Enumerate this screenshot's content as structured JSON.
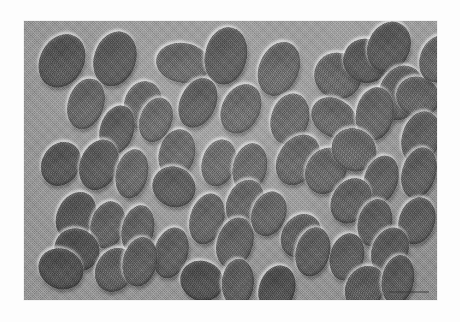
{
  "figure": {
    "kind": "light-micrograph",
    "caption": "",
    "plate": {
      "background_color": "#9c9c9c",
      "page_color": "#ffffff",
      "cell_fill_color": "#5f5f5f",
      "cell_dark_color": "#4a4a4a",
      "cell_highlight_color": "#ffffff",
      "left": 24,
      "top": 21,
      "width": 413,
      "height": 279
    },
    "overlays": {
      "scale_bar_label": ""
    },
    "specimen": {
      "object_name": "ellipsoidal-cell",
      "count": 57
    }
  },
  "cells": [
    {
      "x": 16,
      "y": 12,
      "w": 44,
      "h": 56,
      "rot": 28,
      "tone": "dark"
    },
    {
      "x": 70,
      "y": 10,
      "w": 42,
      "h": 56,
      "rot": 18,
      "tone": "dark"
    },
    {
      "x": 132,
      "y": 22,
      "w": 54,
      "h": 40,
      "rot": 8,
      "tone": "mid"
    },
    {
      "x": 181,
      "y": 6,
      "w": 42,
      "h": 58,
      "rot": 12,
      "tone": "dark"
    },
    {
      "x": 235,
      "y": 20,
      "w": 40,
      "h": 56,
      "rot": 22,
      "tone": "mid"
    },
    {
      "x": 290,
      "y": 32,
      "w": 48,
      "h": 46,
      "rot": 34,
      "tone": "mid"
    },
    {
      "x": 319,
      "y": 18,
      "w": 46,
      "h": 44,
      "rot": 28,
      "tone": "dark"
    },
    {
      "x": 344,
      "y": 0,
      "w": 42,
      "h": 52,
      "rot": 24,
      "tone": "dark"
    },
    {
      "x": 355,
      "y": 44,
      "w": 44,
      "h": 56,
      "rot": 22,
      "tone": "mid"
    },
    {
      "x": 44,
      "y": 57,
      "w": 36,
      "h": 52,
      "rot": 18,
      "tone": "mid"
    },
    {
      "x": 100,
      "y": 60,
      "w": 38,
      "h": 48,
      "rot": 14,
      "tone": "mid"
    },
    {
      "x": 156,
      "y": 56,
      "w": 36,
      "h": 52,
      "rot": 24,
      "tone": "dark"
    },
    {
      "x": 76,
      "y": 84,
      "w": 34,
      "h": 50,
      "rot": 16,
      "tone": "dark"
    },
    {
      "x": 198,
      "y": 62,
      "w": 38,
      "h": 52,
      "rot": 26,
      "tone": "mid"
    },
    {
      "x": 247,
      "y": 72,
      "w": 38,
      "h": 52,
      "rot": 16,
      "tone": "mid"
    },
    {
      "x": 286,
      "y": 78,
      "w": 48,
      "h": 38,
      "rot": 32,
      "tone": "mid"
    },
    {
      "x": 332,
      "y": 66,
      "w": 38,
      "h": 54,
      "rot": 10,
      "tone": "mid"
    },
    {
      "x": 372,
      "y": 56,
      "w": 44,
      "h": 40,
      "rot": 24,
      "tone": "mid"
    },
    {
      "x": 378,
      "y": 90,
      "w": 38,
      "h": 54,
      "rot": 16,
      "tone": "mid"
    },
    {
      "x": 18,
      "y": 120,
      "w": 38,
      "h": 46,
      "rot": 30,
      "tone": "dark"
    },
    {
      "x": 56,
      "y": 118,
      "w": 38,
      "h": 52,
      "rot": 20,
      "tone": "dark"
    },
    {
      "x": 92,
      "y": 128,
      "w": 32,
      "h": 50,
      "rot": 12,
      "tone": "mid"
    },
    {
      "x": 135,
      "y": 108,
      "w": 36,
      "h": 50,
      "rot": 14,
      "tone": "mid"
    },
    {
      "x": 178,
      "y": 118,
      "w": 34,
      "h": 48,
      "rot": 16,
      "tone": "mid"
    },
    {
      "x": 209,
      "y": 122,
      "w": 34,
      "h": 50,
      "rot": 12,
      "tone": "mid"
    },
    {
      "x": 254,
      "y": 112,
      "w": 40,
      "h": 54,
      "rot": 32,
      "tone": "mid"
    },
    {
      "x": 282,
      "y": 126,
      "w": 40,
      "h": 48,
      "rot": 28,
      "tone": "mid"
    },
    {
      "x": 307,
      "y": 108,
      "w": 46,
      "h": 42,
      "rot": 36,
      "tone": "mid"
    },
    {
      "x": 340,
      "y": 134,
      "w": 34,
      "h": 50,
      "rot": 18,
      "tone": "mid"
    },
    {
      "x": 378,
      "y": 126,
      "w": 34,
      "h": 52,
      "rot": 16,
      "tone": "mid"
    },
    {
      "x": 128,
      "y": 146,
      "w": 44,
      "h": 40,
      "rot": 28,
      "tone": "dark"
    },
    {
      "x": 33,
      "y": 170,
      "w": 38,
      "h": 50,
      "rot": 26,
      "tone": "dark"
    },
    {
      "x": 67,
      "y": 180,
      "w": 34,
      "h": 48,
      "rot": 14,
      "tone": "mid"
    },
    {
      "x": 98,
      "y": 184,
      "w": 32,
      "h": 50,
      "rot": 12,
      "tone": "mid"
    },
    {
      "x": 166,
      "y": 172,
      "w": 34,
      "h": 52,
      "rot": 16,
      "tone": "mid"
    },
    {
      "x": 203,
      "y": 158,
      "w": 36,
      "h": 48,
      "rot": 24,
      "tone": "mid"
    },
    {
      "x": 308,
      "y": 156,
      "w": 38,
      "h": 48,
      "rot": 32,
      "tone": "mid"
    },
    {
      "x": 334,
      "y": 178,
      "w": 34,
      "h": 48,
      "rot": 14,
      "tone": "mid"
    },
    {
      "x": 375,
      "y": 176,
      "w": 36,
      "h": 48,
      "rot": 18,
      "tone": "mid"
    },
    {
      "x": 30,
      "y": 208,
      "w": 46,
      "h": 42,
      "rot": 28,
      "tone": "dark"
    },
    {
      "x": 130,
      "y": 206,
      "w": 34,
      "h": 52,
      "rot": 16,
      "tone": "mid"
    },
    {
      "x": 193,
      "y": 196,
      "w": 36,
      "h": 52,
      "rot": 18,
      "tone": "mid"
    },
    {
      "x": 258,
      "y": 192,
      "w": 38,
      "h": 46,
      "rot": 32,
      "tone": "mid"
    },
    {
      "x": 306,
      "y": 212,
      "w": 34,
      "h": 48,
      "rot": 14,
      "tone": "mid"
    },
    {
      "x": 348,
      "y": 206,
      "w": 36,
      "h": 48,
      "rot": 22,
      "tone": "mid"
    },
    {
      "x": 72,
      "y": 226,
      "w": 38,
      "h": 46,
      "rot": 30,
      "tone": "mid"
    },
    {
      "x": 99,
      "y": 216,
      "w": 34,
      "h": 50,
      "rot": 12,
      "tone": "mid"
    },
    {
      "x": 14,
      "y": 228,
      "w": 46,
      "h": 40,
      "rot": 26,
      "tone": "dark"
    },
    {
      "x": 156,
      "y": 240,
      "w": 44,
      "h": 40,
      "rot": 24,
      "tone": "dark"
    },
    {
      "x": 198,
      "y": 238,
      "w": 32,
      "h": 48,
      "rot": 4,
      "tone": "mid"
    },
    {
      "x": 235,
      "y": 244,
      "w": 36,
      "h": 48,
      "rot": 18,
      "tone": "dark"
    },
    {
      "x": 272,
      "y": 206,
      "w": 34,
      "h": 50,
      "rot": 14,
      "tone": "mid"
    },
    {
      "x": 322,
      "y": 244,
      "w": 38,
      "h": 46,
      "rot": 30,
      "tone": "mid"
    },
    {
      "x": 358,
      "y": 234,
      "w": 32,
      "h": 50,
      "rot": 10,
      "tone": "mid"
    },
    {
      "x": 116,
      "y": 76,
      "w": 32,
      "h": 46,
      "rot": 20,
      "tone": "mid"
    },
    {
      "x": 228,
      "y": 170,
      "w": 34,
      "h": 46,
      "rot": 20,
      "tone": "mid"
    },
    {
      "x": 396,
      "y": 14,
      "w": 36,
      "h": 48,
      "rot": 20,
      "tone": "mid"
    }
  ]
}
